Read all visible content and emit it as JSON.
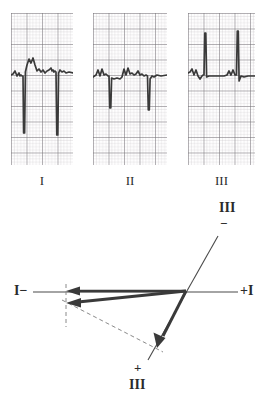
{
  "figure": {
    "background_color": "#ffffff",
    "trace_color": "#3a3a3a",
    "grid_minor_color": "#b9b4b8",
    "grid_major_color": "#6e6a70",
    "label_color": "#2b2b2b",
    "width": 275,
    "height": 409
  },
  "ecg_strips": [
    {
      "id": "strip-lead-1",
      "label": "I",
      "lead_name": "Lead I",
      "polarity": "negative",
      "description": "Deep negative QS complexes with positive T waves",
      "x": 11,
      "y": 13,
      "width": 62,
      "height": 152,
      "baseline_y": 62,
      "grid_minor": 3.1,
      "grid_major": 15.5
    },
    {
      "id": "strip-lead-2",
      "label": "II",
      "lead_name": "Lead II",
      "polarity": "negative",
      "description": "Negative QS complexes of moderate depth",
      "x": 93,
      "y": 13,
      "width": 74,
      "height": 152,
      "baseline_y": 62,
      "grid_minor": 3.1,
      "grid_major": 15.5
    },
    {
      "id": "strip-lead-3",
      "label": "III",
      "lead_name": "Lead III",
      "polarity": "positive",
      "description": "Tall positive R waves",
      "x": 188,
      "y": 13,
      "width": 67,
      "height": 152,
      "baseline_y": 62,
      "grid_minor": 3.1,
      "grid_major": 15.5
    }
  ],
  "vector_diagram": {
    "id": "axis-vector-diagram",
    "origin": {
      "x": 186,
      "y": 292
    },
    "axes": [
      {
        "name": "lead-I-axis",
        "label_negative": "I−",
        "label_positive": "+I",
        "orientation": "horizontal",
        "x1": 33,
        "y1": 292,
        "x2": 238,
        "y2": 292
      },
      {
        "name": "lead-III-axis",
        "label_negative": "III",
        "negative_sign": "−",
        "label_positive": "III",
        "positive_sign": "+",
        "orientation": "oblique",
        "x1": 218,
        "y1": 236,
        "x2": 148,
        "y2": 360
      }
    ],
    "vectors": [
      {
        "name": "lead-I-deflection-vector",
        "description": "Thick arrow along lead I axis pointing to negative I",
        "from_x": 186,
        "from_y": 291,
        "to_x": 67,
        "to_y": 291,
        "arrowhead": "left"
      },
      {
        "name": "mean-axis-resultant-vector",
        "description": "Thick arrow from origin to resultant point, left and slightly down",
        "from_x": 186,
        "from_y": 291,
        "to_x": 67,
        "to_y": 303,
        "arrowhead": "left"
      },
      {
        "name": "lead-III-deflection-vector",
        "description": "Thick arrow along lead III axis pointing to positive III",
        "from_x": 186,
        "from_y": 291,
        "to_x": 157,
        "to_y": 348,
        "arrowhead": "down-left"
      }
    ],
    "construction_lines": [
      {
        "name": "perpendicular-dashed-lead-I",
        "style": "dashed",
        "x1": 66,
        "y1": 284,
        "x2": 66,
        "y2": 327
      },
      {
        "name": "perpendicular-dashed-lead-III",
        "style": "dashed",
        "x1": 62,
        "y1": 300,
        "x2": 163,
        "y2": 352
      }
    ],
    "labels": [
      {
        "name": "lead-I-negative-label",
        "text": "I−",
        "x": 14,
        "y": 285
      },
      {
        "name": "lead-I-positive-label",
        "text": "+I",
        "x": 240,
        "y": 285
      },
      {
        "name": "lead-III-negative-numeral",
        "text": "III",
        "x": 219,
        "y": 203
      },
      {
        "name": "lead-III-negative-sign",
        "text": "−",
        "x": 219,
        "y": 222
      },
      {
        "name": "lead-III-positive-sign",
        "text": "+",
        "x": 133,
        "y": 368
      },
      {
        "name": "lead-III-positive-numeral",
        "text": "III",
        "x": 129,
        "y": 382
      }
    ]
  }
}
